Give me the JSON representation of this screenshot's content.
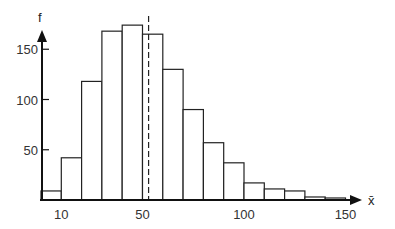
{
  "chart_data": {
    "type": "bar",
    "subtype": "histogram",
    "title": "",
    "xlabel": "x̄",
    "ylabel": "f",
    "bin_width": 10,
    "bins": [
      [
        0,
        10
      ],
      [
        10,
        20
      ],
      [
        20,
        30
      ],
      [
        30,
        40
      ],
      [
        40,
        50
      ],
      [
        50,
        60
      ],
      [
        60,
        70
      ],
      [
        70,
        80
      ],
      [
        80,
        90
      ],
      [
        90,
        100
      ],
      [
        100,
        110
      ],
      [
        110,
        120
      ],
      [
        120,
        130
      ],
      [
        130,
        140
      ],
      [
        140,
        150
      ]
    ],
    "values": [
      9,
      42,
      118,
      168,
      174,
      165,
      130,
      90,
      57,
      37,
      17,
      11,
      9,
      3,
      2
    ],
    "x_ticks": [
      10,
      50,
      100,
      150
    ],
    "x_tick_labels": [
      "10",
      "50",
      "100",
      "150"
    ],
    "y_ticks": [
      50,
      100,
      150
    ],
    "y_tick_labels": [
      "50",
      "100",
      "150"
    ],
    "xlim": [
      0,
      155
    ],
    "ylim": [
      0,
      185
    ],
    "grid": false,
    "legend": null,
    "annotations": [
      {
        "type": "dashed-vertical-line",
        "x": 53,
        "description": "mean marker"
      }
    ]
  },
  "colors": {
    "bar_fill": "#ffffff",
    "bar_stroke": "#222222",
    "axis": "#111111"
  }
}
